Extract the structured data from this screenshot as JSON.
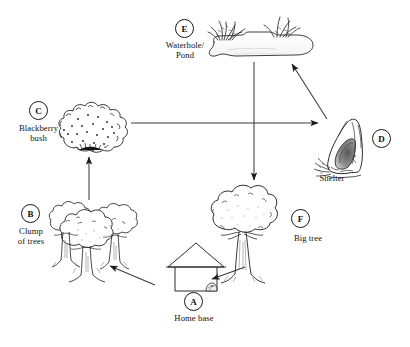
{
  "diagram": {
    "style": {
      "stroke": "#2b2b2b",
      "arrow_fill": "#1a1a1a",
      "background": "#ffffff",
      "shade": "#f2f2f2"
    },
    "nodes": [
      {
        "id": "A",
        "badge": "A",
        "label": "Home base",
        "icon": "hut-icon",
        "badge_x": 184,
        "badge_y": 292,
        "label_x": 155,
        "label_y": 313,
        "label_w": 78
      },
      {
        "id": "B",
        "badge": "B",
        "label": "Clump\nof trees",
        "icon": "clump-of-trees-icon",
        "badge_x": 21,
        "badge_y": 204,
        "label_x": 0,
        "label_y": 226,
        "label_w": 62
      },
      {
        "id": "C",
        "badge": "C",
        "label": "Blackberry\nbush",
        "icon": "blackberry-bush-icon",
        "badge_x": 29,
        "badge_y": 101,
        "label_x": 0,
        "label_y": 123,
        "label_w": 77
      },
      {
        "id": "D",
        "badge": "D",
        "label": "Shelter",
        "icon": "shelter-cave-icon",
        "badge_x": 372,
        "badge_y": 129,
        "label_x": 301,
        "label_y": 173,
        "label_w": 62
      },
      {
        "id": "E",
        "badge": "E",
        "label": "Waterhole/\nPond",
        "icon": "waterhole-pond-icon",
        "badge_x": 175,
        "badge_y": 19,
        "label_x": 146,
        "label_y": 40,
        "label_w": 78
      },
      {
        "id": "F",
        "badge": "F",
        "label": "Big tree",
        "icon": "big-tree-icon",
        "badge_x": 291,
        "badge_y": 209,
        "label_x": 277,
        "label_y": 233,
        "label_w": 62
      }
    ],
    "edges": [
      {
        "id": "A-to-B",
        "from": "A",
        "to": "B",
        "kind": "arrow",
        "direction": "up-left"
      },
      {
        "id": "B-to-C",
        "from": "B",
        "to": "C",
        "kind": "arrow",
        "direction": "up"
      },
      {
        "id": "C-to-D",
        "from": "C",
        "to": "D",
        "kind": "arrow",
        "direction": "right"
      },
      {
        "id": "D-to-E",
        "from": "D",
        "to": "E",
        "kind": "arrow",
        "direction": "up-left"
      },
      {
        "id": "E-to-F",
        "from": "E",
        "to": "F",
        "kind": "arrow",
        "direction": "down"
      },
      {
        "id": "F-to-A",
        "from": "F",
        "to": "A",
        "kind": "arrow",
        "direction": "left"
      }
    ]
  }
}
